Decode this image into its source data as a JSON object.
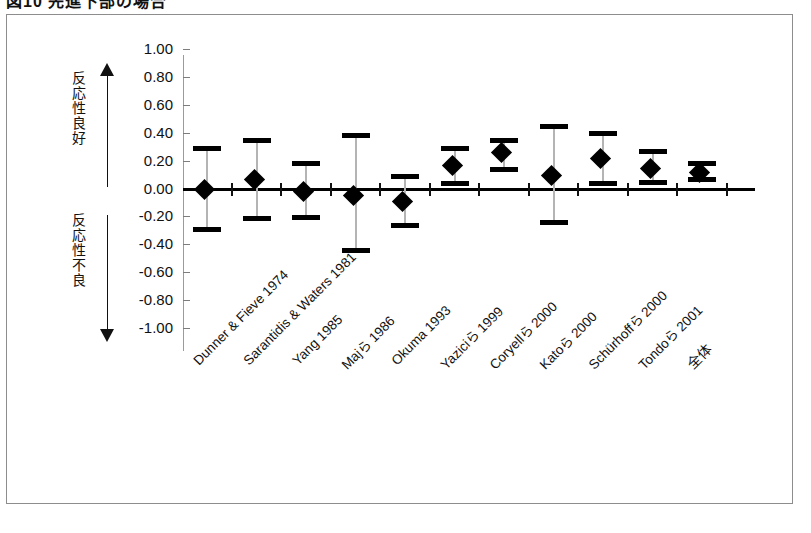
{
  "figure": {
    "caption": "図10  先進下部の場合",
    "axis_labels": {
      "up_arrow_label": "反応性良好",
      "down_arrow_label": "反応性不良",
      "up_arrow_icon": "up-arrow-icon",
      "down_arrow_icon": "down-arrow-icon"
    }
  },
  "chart_data": {
    "type": "scatter",
    "title": "図10  先進下部の場合",
    "xlabel": "",
    "ylabel": "",
    "ylim": [
      -1.0,
      1.0
    ],
    "grid": false,
    "legend": null,
    "zero_reference_line": 0.0,
    "ytick_labels": [
      "1.00",
      "0.80",
      "0.60",
      "0.40",
      "0.20",
      "0.00",
      "-0.20",
      "-0.40",
      "-0.60",
      "-0.80",
      "-1.00"
    ],
    "ytick_values": [
      1.0,
      0.8,
      0.6,
      0.4,
      0.2,
      0.0,
      -0.2,
      -0.4,
      -0.6,
      -0.8,
      -1.0
    ],
    "categories": [
      "Dunner & Fieve 1974",
      "Sarantidis & Waters 1981",
      "Yang 1985",
      "Majら 1986",
      "Okuma 1993",
      "Yaziciら 1999",
      "Coryellら 2000",
      "Katoら 2000",
      "Schürhoffら 2000",
      "Tondoら 2001",
      "全体"
    ],
    "series": [
      {
        "name": "effect-size",
        "values": [
          0.0,
          0.07,
          -0.02,
          -0.05,
          -0.09,
          0.17,
          0.26,
          0.1,
          0.22,
          0.15,
          0.12
        ],
        "ci_lower": [
          -0.3,
          -0.22,
          -0.21,
          -0.45,
          -0.27,
          0.03,
          0.13,
          -0.25,
          0.03,
          0.04,
          0.06
        ],
        "ci_upper": [
          0.29,
          0.35,
          0.18,
          0.38,
          0.09,
          0.29,
          0.35,
          0.45,
          0.4,
          0.27,
          0.18
        ]
      }
    ]
  },
  "colors": {
    "marker": "#000000",
    "whisker": "#b4b4b4",
    "axis": "#9b9b9b",
    "zero_line": "#000000",
    "border": "#8d8d8d"
  }
}
